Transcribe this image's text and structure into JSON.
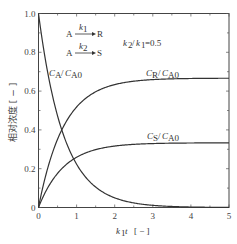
{
  "chart_data": {
    "type": "line",
    "title": "",
    "xlabel": "k1 t [-]",
    "ylabel": "相对浓度 [-]",
    "xlim": [
      0,
      5
    ],
    "ylim": [
      0,
      1.0
    ],
    "x_ticks": [
      "0",
      "1",
      "2",
      "3",
      "4",
      "5"
    ],
    "y_ticks": [
      "0",
      "0.2",
      "0.4",
      "0.6",
      "0.8",
      "1.0"
    ],
    "grid": false,
    "legend": "none (inline curve labels)",
    "annotations": {
      "reaction1": "A --k1--> R",
      "reaction2": "A --k2--> S",
      "ratio": "k2/k1 = 0.5"
    },
    "series": [
      {
        "name": "CA/CA0",
        "x": [
          0,
          0.25,
          0.5,
          0.75,
          1,
          1.5,
          2,
          2.5,
          3,
          3.5,
          4,
          5
        ],
        "values": [
          1.0,
          0.69,
          0.47,
          0.32,
          0.22,
          0.11,
          0.05,
          0.02,
          0.01,
          0.0,
          0.0,
          0.0
        ]
      },
      {
        "name": "CR/CA0",
        "x": [
          0,
          0.25,
          0.5,
          0.75,
          1,
          1.5,
          2,
          2.5,
          3,
          3.5,
          4,
          5
        ],
        "values": [
          0.0,
          0.21,
          0.35,
          0.45,
          0.52,
          0.59,
          0.63,
          0.65,
          0.66,
          0.665,
          0.667,
          0.667
        ]
      },
      {
        "name": "CS/CA0",
        "x": [
          0,
          0.25,
          0.5,
          0.75,
          1,
          1.5,
          2,
          2.5,
          3,
          3.5,
          4,
          5
        ],
        "values": [
          0.0,
          0.1,
          0.18,
          0.23,
          0.26,
          0.3,
          0.32,
          0.33,
          0.33,
          0.333,
          0.333,
          0.333
        ]
      }
    ],
    "curve_labels": {
      "CA": {
        "main": "C",
        "sub1": "A",
        "sep": "/",
        "main2": "C",
        "sub2": "A0"
      },
      "CR": {
        "main": "C",
        "sub1": "R",
        "sep": "/",
        "main2": "C",
        "sub2": "A0"
      },
      "CS": {
        "main": "C",
        "sub1": "S",
        "sep": "/",
        "main2": "C",
        "sub2": "A0"
      }
    }
  },
  "labels": {
    "xlabel_k": "k",
    "xlabel_sub": "1",
    "xlabel_t": "t",
    "xlabel_unit": "[ − ]",
    "ylabel": "相对浓度 [ − ]",
    "r1_A": "A",
    "r1_k": "k",
    "r1_ksub": "1",
    "r1_R": "R",
    "r2_A": "A",
    "r2_k": "k",
    "r2_ksub": "2",
    "r2_S": "S",
    "ratio_k2": "k",
    "ratio_k2sub": "2",
    "ratio_sep": "/",
    "ratio_k1": "k",
    "ratio_k1sub": "1",
    "ratio_val": "=0.5"
  }
}
